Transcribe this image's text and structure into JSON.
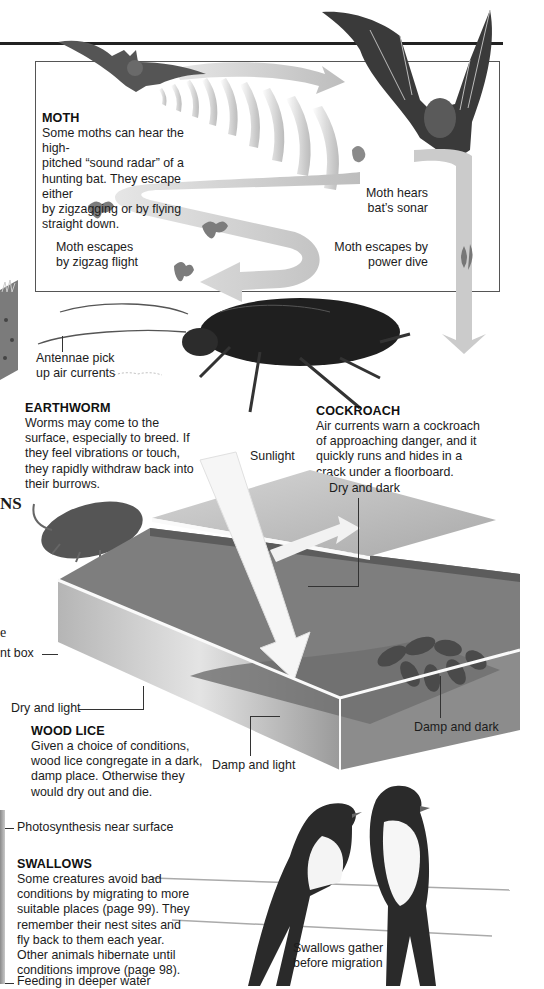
{
  "page": {
    "top_rule": true,
    "left_fragments": {
      "heading_fragment": "NS",
      "text_fragment": "e",
      "label_fragment": "nt box"
    }
  },
  "moth_panel": {
    "heading": "MOTH",
    "body": [
      "Some moths can hear the high-",
      "pitched “sound radar” of a",
      "hunting bat. They escape either",
      "by zigzagging or by flying",
      "straight down."
    ],
    "labels": {
      "hears": [
        "Moth hears",
        "bat’s sonar"
      ],
      "zigzag": [
        "Moth escapes",
        "by zigzag flight"
      ],
      "dive": [
        "Moth escapes by",
        "power dive"
      ]
    }
  },
  "cockroach": {
    "antennae_label": [
      "Antennae pick",
      "up air currents"
    ],
    "heading": "COCKROACH",
    "body": [
      "Air currents warn a cockroach",
      "of approaching danger, and it",
      "quickly runs and hides in a",
      "crack under a floorboard."
    ]
  },
  "earthworm": {
    "heading": "EARTHWORM",
    "body": [
      "Worms may come to the",
      "surface, especially to breed. If",
      "they feel vibrations or touch,",
      "they rapidly withdraw back into",
      "their burrows."
    ]
  },
  "woodlice_box": {
    "sunlight_label": "Sunlight",
    "labels": {
      "dry_dark": "Dry and dark",
      "dry_light": "Dry and light",
      "damp_dark": "Damp and dark",
      "damp_light": "Damp and light"
    },
    "heading": "WOOD LICE",
    "body": [
      "Given a choice of conditions,",
      "wood lice congregate in a dark,",
      "damp place. Otherwise they",
      "would dry out and die."
    ]
  },
  "pond_fragment": {
    "label_top": "Photosynthesis near surface",
    "label_bottom": "Feeding in deeper water"
  },
  "swallows": {
    "heading": "SWALLOWS",
    "body": [
      "Some creatures avoid bad",
      "conditions by migrating to more",
      "suitable places (page 99). They",
      "remember their nest sites and",
      "fly back to them each year.",
      "Other animals hibernate until",
      "conditions improve (page 98)."
    ],
    "caption": [
      "Swallows gather",
      "before migration"
    ]
  },
  "colors": {
    "rule": "#222222",
    "arrow_grey": "#c8c8c8",
    "box_grey": "#8f8f8f",
    "dark_insect": "#1e1e1e"
  }
}
